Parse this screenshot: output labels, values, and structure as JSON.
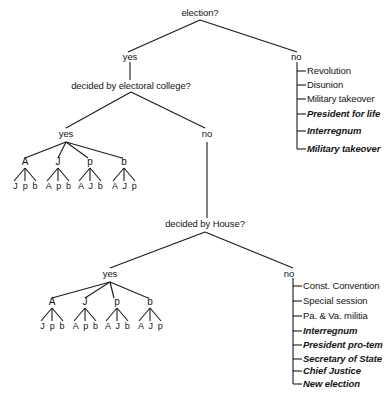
{
  "diagram": {
    "title": "election?",
    "type": "decision-tree",
    "background_color": "#ffffff",
    "line_color": "#1a1a1a"
  },
  "nodes": {
    "root_question": "election?",
    "root_yes": "yes",
    "root_no": "no",
    "electoral_question": "decided by electoral college?",
    "electoral_yes": "yes",
    "electoral_no": "no",
    "house_question": "decided by House?",
    "house_yes": "yes",
    "house_no": "no"
  },
  "electoral_college_leaves": [
    {
      "letter": "A",
      "children": "J p b"
    },
    {
      "letter": "J",
      "children": "A p b"
    },
    {
      "letter": "p",
      "children": "A J b"
    },
    {
      "letter": "b",
      "children": "A J p"
    }
  ],
  "house_leaves": [
    {
      "letter": "A",
      "children": "J p b"
    },
    {
      "letter": "J",
      "children": "A p b"
    },
    {
      "letter": "p",
      "children": "A J b"
    },
    {
      "letter": "b",
      "children": "A J p"
    }
  ],
  "no_election_outcomes": [
    {
      "label": "Revolution",
      "style": "upright"
    },
    {
      "label": "Disunion",
      "style": "upright"
    },
    {
      "label": "Military takeover",
      "style": "upright"
    },
    {
      "label": "President for life",
      "style": "italic"
    },
    {
      "label": "Interregnum",
      "style": "italic"
    },
    {
      "label": "Military takeover",
      "style": "italic"
    }
  ],
  "no_house_outcomes": [
    {
      "label": "Const. Convention",
      "style": "upright"
    },
    {
      "label": "Special session",
      "style": "upright"
    },
    {
      "label": "Pa. & Va. militia",
      "style": "upright"
    },
    {
      "label": "Interregnum",
      "style": "italic"
    },
    {
      "label": "President pro-tem",
      "style": "italic"
    },
    {
      "label": "Secretary of State",
      "style": "italic"
    },
    {
      "label": "Chief Justice",
      "style": "italic"
    },
    {
      "label": "New election",
      "style": "italic"
    }
  ]
}
